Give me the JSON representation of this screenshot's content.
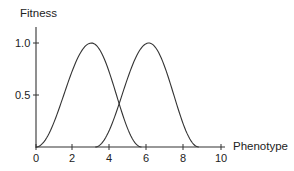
{
  "chart_data": {
    "type": "line",
    "title": "",
    "xlabel": "Phenotype",
    "ylabel": "Fitness",
    "xlim": [
      0,
      10
    ],
    "ylim": [
      0,
      1.0
    ],
    "x_ticks": [
      0,
      2,
      4,
      6,
      8,
      10
    ],
    "x_tick_labels": [
      "0",
      "2",
      "4",
      "6",
      "8",
      "10"
    ],
    "y_ticks": [
      0.5,
      1.0
    ],
    "y_tick_labels": [
      "0.5",
      "1.0"
    ],
    "grid": false,
    "legend": null,
    "series": [
      {
        "name": "Fitness curve 1",
        "shape": "bell",
        "peak_x": 3.0,
        "peak_y": 1.0,
        "support": [
          0.0,
          5.7
        ],
        "x": [
          0,
          0.5,
          1.0,
          1.5,
          2.0,
          2.5,
          3.0,
          3.5,
          4.0,
          4.5,
          5.0,
          5.5,
          5.7
        ],
        "values": [
          0,
          0.03,
          0.12,
          0.3,
          0.58,
          0.87,
          1.0,
          0.87,
          0.58,
          0.3,
          0.12,
          0.02,
          0
        ]
      },
      {
        "name": "Fitness curve 2",
        "shape": "bell",
        "peak_x": 6.1,
        "peak_y": 1.0,
        "support": [
          3.2,
          8.8
        ],
        "x": [
          3.2,
          3.6,
          4.1,
          4.6,
          5.1,
          5.6,
          6.1,
          6.6,
          7.1,
          7.6,
          8.1,
          8.6,
          8.8
        ],
        "values": [
          0,
          0.03,
          0.12,
          0.3,
          0.58,
          0.87,
          1.0,
          0.87,
          0.58,
          0.3,
          0.12,
          0.02,
          0
        ]
      }
    ]
  },
  "labels": {
    "ylabel": "Fitness",
    "xlabel": "Phenotype",
    "y_ticks": [
      "1.0",
      "0.5"
    ],
    "x_ticks": [
      "0",
      "2",
      "4",
      "6",
      "8",
      "10"
    ]
  }
}
